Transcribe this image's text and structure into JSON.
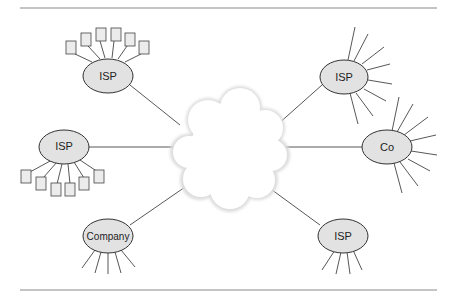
{
  "diagram": {
    "title": "",
    "colors": {
      "node_fill": "#e2e2e2",
      "node_stroke": "#333333",
      "cloud_fill": "#ffffff",
      "cloud_shadow": "#d8d8d8",
      "line": "#444444",
      "rule": "#8a8a8a"
    },
    "center": {
      "id": "internet-cloud",
      "label": ""
    },
    "nodes": [
      {
        "id": "isp-top-left",
        "label": "ISP",
        "attached": "6 servers"
      },
      {
        "id": "isp-left",
        "label": "ISP",
        "attached": "6 servers"
      },
      {
        "id": "company-bottom-left",
        "label": "Company",
        "attached": "5 lines"
      },
      {
        "id": "isp-top-right",
        "label": "ISP",
        "attached": "8 lines"
      },
      {
        "id": "co-right",
        "label": "Co",
        "attached": "8 lines"
      },
      {
        "id": "isp-bottom-right",
        "label": "ISP",
        "attached": "4 lines"
      }
    ]
  }
}
